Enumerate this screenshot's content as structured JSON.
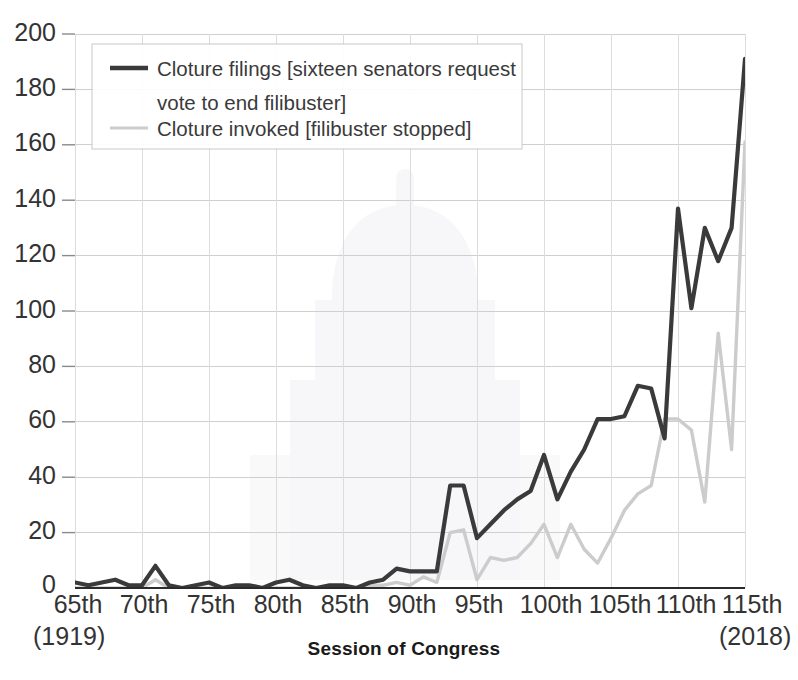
{
  "chart_data": {
    "type": "line",
    "title": "",
    "xlabel": "Session of Congress",
    "ylabel": "",
    "ylim": [
      0,
      200
    ],
    "ytick_step": 20,
    "grid": true,
    "legend_position": "top-left",
    "x_start_label": "(1919)",
    "x_end_label": "(2018)",
    "x_tick_labels": [
      "65th",
      "70th",
      "75th",
      "80th",
      "85th",
      "90th",
      "95th",
      "100th",
      "105th",
      "110th",
      "115th"
    ],
    "ytick_labels": [
      "0",
      "20",
      "40",
      "60",
      "80",
      "100",
      "120",
      "140",
      "160",
      "180",
      "200"
    ],
    "x": [
      65,
      66,
      67,
      68,
      69,
      70,
      71,
      72,
      73,
      74,
      75,
      76,
      77,
      78,
      79,
      80,
      81,
      82,
      83,
      84,
      85,
      86,
      87,
      88,
      89,
      90,
      91,
      92,
      93,
      94,
      95,
      96,
      97,
      98,
      99,
      100,
      101,
      102,
      103,
      104,
      105,
      106,
      107,
      108,
      109,
      110,
      111,
      112,
      113,
      114,
      115
    ],
    "series": [
      {
        "name": "Cloture filings [sixteen senators request vote to end filibuster]",
        "color": "#3a3a3a",
        "style": "solid-dark",
        "values": [
          2,
          1,
          2,
          3,
          1,
          1,
          8,
          1,
          0,
          1,
          2,
          0,
          1,
          1,
          0,
          2,
          3,
          1,
          0,
          1,
          1,
          0,
          2,
          3,
          7,
          6,
          6,
          6,
          37,
          37,
          18,
          23,
          28,
          32,
          35,
          48,
          32,
          42,
          50,
          61,
          61,
          62,
          73,
          72,
          54,
          137,
          101,
          130,
          118,
          130,
          191
        ]
      },
      {
        "name": "Cloture invoked [filibuster stopped]",
        "color": "#cccccc",
        "style": "solid-light",
        "values": [
          0,
          0,
          0,
          0,
          0,
          0,
          3,
          0,
          0,
          0,
          0,
          0,
          0,
          0,
          0,
          0,
          0,
          0,
          0,
          0,
          0,
          0,
          1,
          1,
          2,
          1,
          4,
          2,
          20,
          21,
          3,
          11,
          10,
          11,
          16,
          23,
          11,
          23,
          14,
          9,
          18,
          28,
          34,
          37,
          34,
          37,
          36,
          32,
          31,
          30,
          31
        ]
      }
    ],
    "series_light_override_note": "",
    "light_values_tail": [
      37,
      61,
      61,
      57,
      31,
      92,
      50,
      161
    ]
  },
  "legend": {
    "entries": [
      {
        "label_line1": "Cloture filings [sixteen senators request",
        "label_line2": "vote to end filibuster]",
        "swatch": "dark-line-swatch"
      },
      {
        "label_line1": "Cloture invoked [filibuster stopped]",
        "label_line2": "",
        "swatch": "light-line-swatch"
      }
    ]
  },
  "axes": {
    "x_title": "Session of Congress",
    "x_first_year": "(1919)",
    "x_last_year": "(2018)"
  },
  "watermark": {
    "name": "capitol-dome-watermark"
  }
}
